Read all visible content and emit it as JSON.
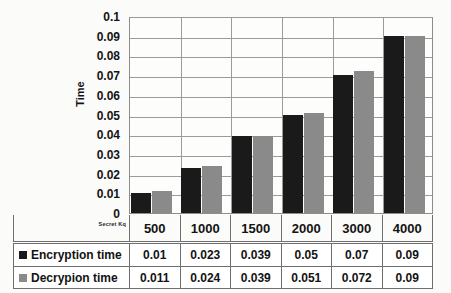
{
  "chart_data": {
    "type": "bar",
    "title": "",
    "xlabel": "Secret Kq",
    "ylabel": "Time",
    "categories": [
      "500",
      "1000",
      "1500",
      "2000",
      "3000",
      "4000"
    ],
    "series": [
      {
        "name": "Encryption time",
        "color": "#1a1a1a",
        "values": [
          0.01,
          0.023,
          0.039,
          0.05,
          0.07,
          0.09
        ]
      },
      {
        "name": "Decrypion time",
        "color": "#8a8a8a",
        "values": [
          0.011,
          0.024,
          0.039,
          0.051,
          0.072,
          0.09
        ]
      }
    ],
    "ylim": [
      0,
      0.1
    ],
    "ytick_labels": [
      "0.1",
      "0.09",
      "0.08",
      "0.07",
      "0.06",
      "0.05",
      "0.04",
      "0.03",
      "0.02",
      "0.01",
      "0"
    ],
    "ytick_values": [
      0.1,
      0.09,
      0.08,
      0.07,
      0.06,
      0.05,
      0.04,
      0.03,
      0.02,
      0.01,
      0
    ],
    "grid": true,
    "legend_position": "table-below"
  },
  "table": {
    "rows": [
      {
        "label": "Encryption time",
        "swatch": "legend-swatch-encryption",
        "cells": [
          "0.01",
          "0.023",
          "0.039",
          "0.05",
          "0.07",
          "0.09"
        ]
      },
      {
        "label": "Decrypion time",
        "swatch": "legend-swatch-decryption",
        "cells": [
          "0.011",
          "0.024",
          "0.039",
          "0.051",
          "0.072",
          "0.09"
        ]
      }
    ]
  }
}
